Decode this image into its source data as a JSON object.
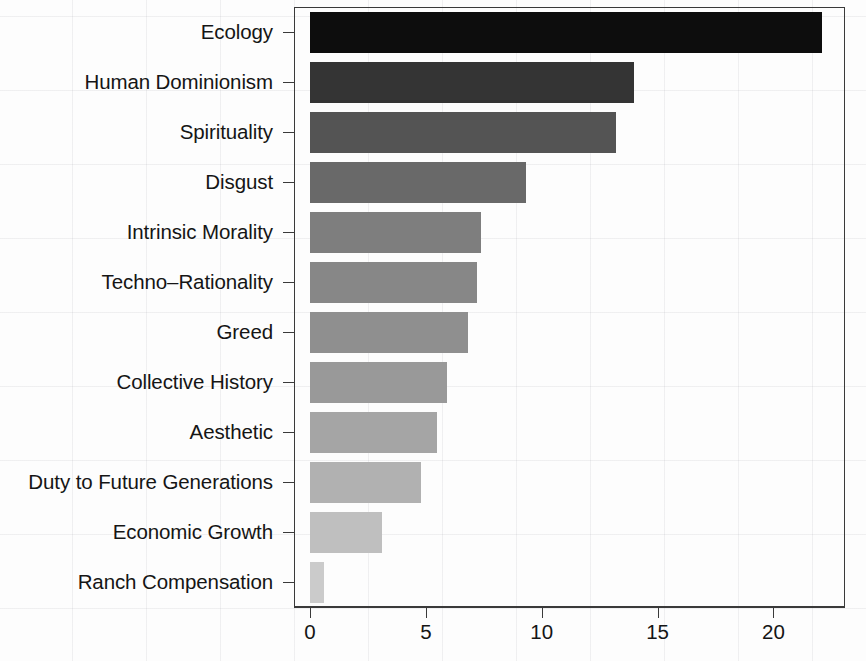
{
  "chart_data": {
    "type": "bar",
    "orientation": "horizontal",
    "title": "",
    "subtitle": "",
    "xlabel": "",
    "ylabel": "",
    "xlim": [
      0,
      23.0
    ],
    "ylim": null,
    "grid": false,
    "legend": null,
    "legend_position": "none",
    "xticks": [
      0,
      5,
      10,
      15,
      20
    ],
    "xtick_labels": [
      "0",
      "5",
      "10",
      "15",
      "20"
    ],
    "categories": [
      "Ecology",
      "Human Dominionism",
      "Spirituality",
      "Disgust",
      "Intrinsic Morality",
      "Techno–Rationality",
      "Greed",
      "Collective History",
      "Aesthetic",
      "Duty to Future Generations",
      "Economic Growth",
      "Ranch Compensation"
    ],
    "values": [
      22.1,
      14.0,
      13.2,
      9.3,
      7.4,
      7.2,
      6.8,
      5.9,
      5.5,
      4.8,
      3.1,
      0.6
    ],
    "bar_colors": [
      "#0d0d0d",
      "#343434",
      "#545454",
      "#696969",
      "#7e7e7e",
      "#878787",
      "#8f8f8f",
      "#999999",
      "#a5a5a5",
      "#b1b1b1",
      "#bfbfbf",
      "#cbcbcb"
    ],
    "annotations": []
  },
  "axis": {
    "frame_color": "#3a3a3a",
    "tick_color": "#3a3a3a",
    "label_color": "#151515"
  }
}
